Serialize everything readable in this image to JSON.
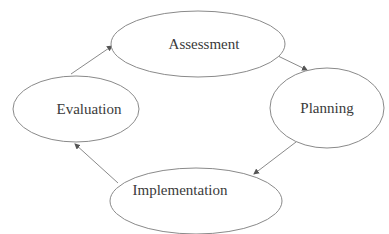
{
  "diagram": {
    "type": "cycle",
    "nodes": [
      {
        "id": "assessment",
        "label": "Assessment",
        "cx": 198,
        "cy": 44,
        "rx": 87,
        "ry": 33
      },
      {
        "id": "planning",
        "label": "Planning",
        "cx": 327,
        "cy": 108,
        "rx": 57,
        "ry": 40
      },
      {
        "id": "implementation",
        "label": "Implementation",
        "cx": 196,
        "cy": 201,
        "rx": 86,
        "ry": 33
      },
      {
        "id": "evaluation",
        "label": "Evaluation",
        "cx": 76,
        "cy": 109,
        "rx": 63,
        "ry": 33
      }
    ],
    "edges": [
      {
        "from": "assessment",
        "to": "planning"
      },
      {
        "from": "planning",
        "to": "implementation"
      },
      {
        "from": "implementation",
        "to": "evaluation"
      },
      {
        "from": "evaluation",
        "to": "assessment"
      }
    ],
    "colors": {
      "stroke": "#8a8a8a",
      "text": "#3a3a3a",
      "arrow": "#555555",
      "background": "#ffffff"
    }
  }
}
